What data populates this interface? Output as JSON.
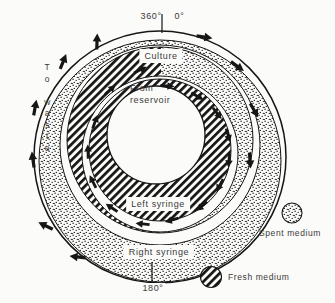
{
  "figure": {
    "title_semantic": "Two-syringe rotating continuous-culture flow diagram",
    "top_scale": {
      "left_value": "360°",
      "right_value": "0°"
    },
    "bottom_scale": {
      "value": "180°"
    },
    "side_label": {
      "text": "To waste",
      "vertical": "T\no\n\nw\na\ns\nt\ne"
    },
    "rings": {
      "culture_label": "Culture",
      "reservoir_label": "From\nreservoir",
      "left_syringe_label": "Left syringe",
      "right_syringe_label": "Right syringe"
    },
    "legend": {
      "spent": {
        "label": "Spent medium",
        "pattern": "stipple-dots"
      },
      "fresh": {
        "label": "Fresh medium",
        "pattern": "diagonal-hatch"
      }
    },
    "colors": {
      "ink": "#161616",
      "paper": "#fbfbf9"
    }
  }
}
